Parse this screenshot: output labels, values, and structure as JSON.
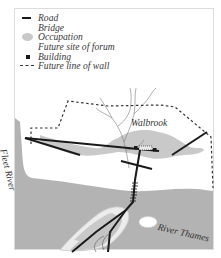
{
  "legend": {
    "items": [
      {
        "symbol": "road-line",
        "label": "Road"
      },
      {
        "symbol": "bridge",
        "label": "Bridge"
      },
      {
        "symbol": "occupation-blob",
        "label": "Occupation"
      },
      {
        "symbol": "forum-site",
        "label": "Future site of forum"
      },
      {
        "symbol": "building-square",
        "label": "Building"
      },
      {
        "symbol": "dashed-line",
        "label": "Future line of wall"
      }
    ]
  },
  "labels": {
    "walbrook": "Walbrook",
    "fleet_river": "Fleet River",
    "river_thames": "River Thames"
  },
  "colors": {
    "river": "#b3b3b3",
    "occupation": "#c9c9c9",
    "road": "#1a1a1a",
    "wall": "#333333",
    "stream": "#777777",
    "frame": "#d8d8d8"
  }
}
